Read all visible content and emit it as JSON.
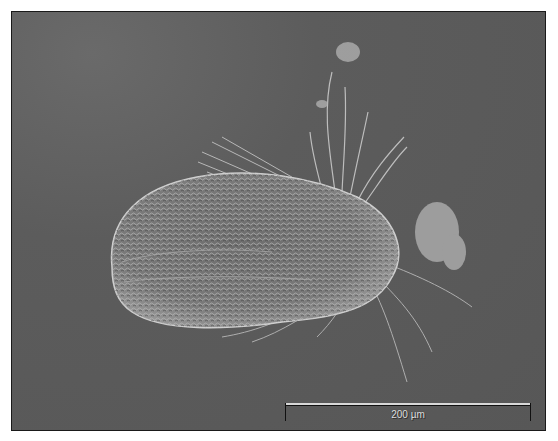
{
  "image": {
    "subject": "ciliate micrograph (DIC)",
    "background_color": "#5a5a5a",
    "frame_color": "#1a1a1a"
  },
  "scale_bar": {
    "label": "200 µm",
    "color": "#d8d8d8"
  }
}
